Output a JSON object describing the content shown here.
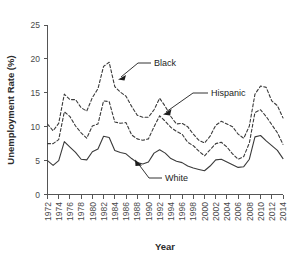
{
  "chart_data": {
    "type": "line",
    "title": "",
    "xlabel": "Year",
    "ylabel": "Unemployment Rate (%)",
    "xlim": [
      1972,
      2014
    ],
    "ylim": [
      0,
      25
    ],
    "ytick_values": [
      0,
      5,
      10,
      15,
      20,
      25
    ],
    "ytick_labels": [
      "0",
      "5",
      "10",
      "15",
      "20",
      "25"
    ],
    "xtick_labels": [
      "1972",
      "1974",
      "1976",
      "1978",
      "1980",
      "1982",
      "1984",
      "1986",
      "1988",
      "1990",
      "1992",
      "1994",
      "1996",
      "1998",
      "2000",
      "2002",
      "2004",
      "2006",
      "2008",
      "2010",
      "2012",
      "2014"
    ],
    "grid": false,
    "legend_position": "inline-annotations",
    "x": [
      1972,
      1973,
      1974,
      1975,
      1976,
      1977,
      1978,
      1979,
      1980,
      1981,
      1982,
      1983,
      1984,
      1985,
      1986,
      1987,
      1988,
      1989,
      1990,
      1991,
      1992,
      1993,
      1994,
      1995,
      1996,
      1997,
      1998,
      1999,
      2000,
      2001,
      2002,
      2003,
      2004,
      2005,
      2006,
      2007,
      2008,
      2009,
      2010,
      2011,
      2012,
      2013,
      2014
    ],
    "series": [
      {
        "name": "Black",
        "style": "dashed",
        "color": "#3a3a3a",
        "values": [
          10.4,
          9.4,
          10.5,
          14.8,
          14.0,
          14.0,
          12.8,
          12.3,
          14.3,
          15.6,
          18.9,
          19.5,
          15.9,
          15.1,
          14.5,
          13.0,
          11.7,
          11.4,
          11.4,
          12.5,
          14.2,
          13.0,
          11.5,
          10.4,
          10.5,
          10.0,
          8.9,
          8.0,
          7.6,
          8.6,
          10.2,
          10.8,
          10.4,
          10.0,
          8.9,
          8.3,
          10.1,
          14.8,
          16.0,
          15.8,
          13.8,
          13.1,
          11.3
        ]
      },
      {
        "name": "Hispanic",
        "style": "dashed",
        "color": "#3a3a3a",
        "values": [
          7.5,
          7.5,
          8.1,
          12.2,
          11.5,
          10.1,
          9.1,
          8.3,
          10.1,
          10.4,
          13.8,
          13.7,
          10.7,
          10.5,
          10.6,
          8.8,
          8.2,
          8.0,
          8.2,
          10.0,
          11.6,
          10.8,
          9.9,
          9.3,
          8.9,
          7.7,
          7.2,
          6.4,
          5.7,
          6.6,
          7.5,
          7.7,
          7.0,
          6.0,
          5.2,
          5.6,
          7.6,
          12.1,
          12.5,
          11.5,
          10.3,
          9.1,
          7.4
        ]
      },
      {
        "name": "White",
        "style": "solid",
        "color": "#3a3a3a",
        "values": [
          5.0,
          4.3,
          5.0,
          7.8,
          7.0,
          6.2,
          5.2,
          5.1,
          6.3,
          6.7,
          8.6,
          8.4,
          6.5,
          6.2,
          6.0,
          5.3,
          4.7,
          4.5,
          4.8,
          6.1,
          6.6,
          6.1,
          5.3,
          4.9,
          4.7,
          4.2,
          3.9,
          3.7,
          3.5,
          4.2,
          5.1,
          5.2,
          4.8,
          4.4,
          4.0,
          4.1,
          5.2,
          8.5,
          8.7,
          7.9,
          7.2,
          6.5,
          5.3
        ]
      }
    ],
    "annotations": [
      {
        "label": "Black",
        "name": "black-annotation"
      },
      {
        "label": "Hispanic",
        "name": "hispanic-annotation"
      },
      {
        "label": "White",
        "name": "white-annotation"
      }
    ]
  }
}
